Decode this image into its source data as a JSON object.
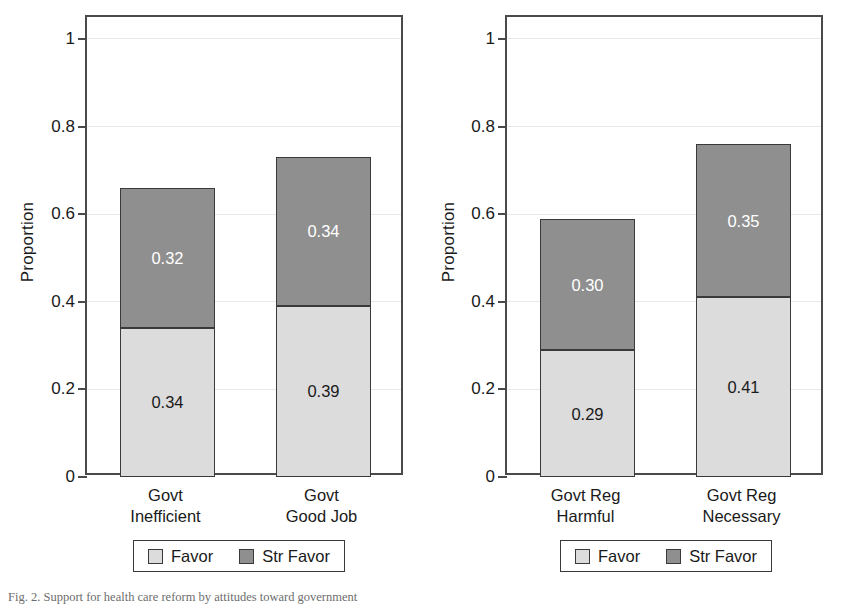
{
  "figure": {
    "caption": "Fig. 2.  Support for health care reform by attitudes toward government"
  },
  "axis": {
    "ylabel": "Proportion",
    "ytick_labels": [
      "0",
      "0.2",
      "0.4",
      "0.6",
      "0.8",
      "1"
    ],
    "ytick_values": [
      0,
      0.2,
      0.4,
      0.6,
      0.8,
      1
    ]
  },
  "legend": {
    "items": [
      {
        "label": "Favor",
        "color": "#dcdcdc"
      },
      {
        "label": "Str Favor",
        "color": "#8f8f8f"
      }
    ]
  },
  "panels": [
    {
      "name": "left",
      "bars": [
        {
          "category_line1": "Govt",
          "category_line2": "Inefficient",
          "favor": "0.34",
          "str_favor": "0.32"
        },
        {
          "category_line1": "Govt",
          "category_line2": "Good Job",
          "favor": "0.39",
          "str_favor": "0.34"
        }
      ]
    },
    {
      "name": "right",
      "bars": [
        {
          "category_line1": "Govt Reg",
          "category_line2": "Harmful",
          "favor": "0.29",
          "str_favor": "0.30"
        },
        {
          "category_line1": "Govt Reg",
          "category_line2": "Necessary",
          "favor": "0.41",
          "str_favor": "0.35"
        }
      ]
    }
  ],
  "chart_data": {
    "type": "bar",
    "subtype": "stacked",
    "title": "",
    "xlabel": "",
    "ylabel": "Proportion",
    "ylim": [
      0,
      1.05
    ],
    "yticks": [
      0,
      0.2,
      0.4,
      0.6,
      0.8,
      1
    ],
    "grid": true,
    "legend_position": "bottom",
    "series": [
      {
        "name": "Favor",
        "color": "#dcdcdc",
        "values": [
          0.34,
          0.39,
          0.29,
          0.41
        ]
      },
      {
        "name": "Str Favor",
        "color": "#8f8f8f",
        "values": [
          0.32,
          0.34,
          0.3,
          0.35
        ]
      }
    ],
    "categories": [
      "Govt Inefficient",
      "Govt Good Job",
      "Govt Reg Harmful",
      "Govt Reg Necessary"
    ],
    "panels": [
      {
        "categories": [
          "Govt Inefficient",
          "Govt Good Job"
        ],
        "series": [
          {
            "name": "Favor",
            "values": [
              0.34,
              0.39
            ]
          },
          {
            "name": "Str Favor",
            "values": [
              0.32,
              0.34
            ]
          }
        ],
        "totals": [
          0.65,
          0.72
        ]
      },
      {
        "categories": [
          "Govt Reg Harmful",
          "Govt Reg Necessary"
        ],
        "series": [
          {
            "name": "Favor",
            "values": [
              0.29,
              0.41
            ]
          },
          {
            "name": "Str Favor",
            "values": [
              0.3,
              0.35
            ]
          }
        ],
        "totals": [
          0.59,
          0.76
        ]
      }
    ]
  }
}
